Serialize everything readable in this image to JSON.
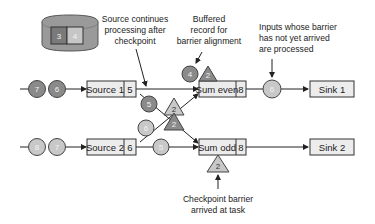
{
  "colors": {
    "dark_record": "#8a8a8a",
    "light_record": "#c8c8c8",
    "box_fill": "#ececec",
    "line": "#222222",
    "state_store": "#9a9a9a"
  },
  "state_store": {
    "cells": [
      "3",
      "4"
    ]
  },
  "annotations": {
    "source_continues": [
      "Source continues",
      "processing after",
      "checkpoint"
    ],
    "buffered": [
      "Buffered",
      "record for",
      "barrier alignment"
    ],
    "inputs_processed": [
      "Inputs whose barrier",
      "has not yet arrived",
      "are processed"
    ],
    "barrier_arrived": [
      "Checkpoint barrier",
      "arrived at task"
    ]
  },
  "tasks": {
    "source1": {
      "label": "Source 1",
      "state": "5"
    },
    "source2": {
      "label": "Source 2",
      "state": "6"
    },
    "sum_even": {
      "label": "Sum even",
      "state": "8"
    },
    "sum_odd": {
      "label": "Sum odd",
      "state": "8"
    },
    "sink1": {
      "label": "Sink 1"
    },
    "sink2": {
      "label": "Sink 2"
    }
  },
  "records": {
    "input1": [
      "7",
      "6"
    ],
    "input2": [
      "8",
      "7"
    ],
    "src1_out": "5",
    "src2_out": "6",
    "src2_to_odd": "5",
    "buffered": "4",
    "even_to_sink": "6"
  },
  "barriers": {
    "at_sum_even": "2",
    "cross_upper": "2",
    "cross_lower": "2",
    "at_sum_odd": "2"
  }
}
